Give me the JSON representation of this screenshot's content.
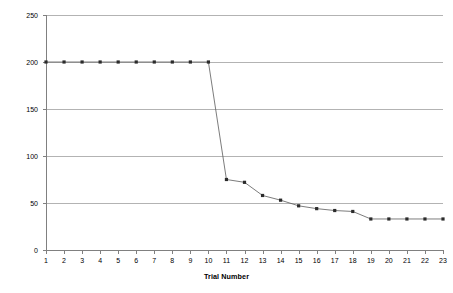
{
  "chart_data": {
    "type": "line",
    "title": "",
    "xlabel": "Trial Number",
    "ylabel": "Number of Moves",
    "x": [
      1,
      2,
      3,
      4,
      5,
      6,
      7,
      8,
      9,
      10,
      11,
      12,
      13,
      14,
      15,
      16,
      17,
      18,
      19,
      20,
      21,
      22,
      23
    ],
    "values": [
      200,
      200,
      200,
      200,
      200,
      200,
      200,
      200,
      200,
      200,
      75,
      72,
      58,
      53,
      47,
      44,
      42,
      41,
      33,
      33,
      33,
      33,
      33
    ],
    "series": [
      {
        "name": "Number of Moves",
        "values": [
          200,
          200,
          200,
          200,
          200,
          200,
          200,
          200,
          200,
          200,
          75,
          72,
          58,
          53,
          47,
          44,
          42,
          41,
          33,
          33,
          33,
          33,
          33
        ]
      }
    ],
    "xlim": [
      1,
      23
    ],
    "ylim": [
      0,
      250
    ],
    "yticks": [
      0,
      50,
      100,
      150,
      200,
      250
    ],
    "xticks": [
      "1",
      "2",
      "3",
      "4",
      "5",
      "6",
      "7",
      "8",
      "9",
      "10",
      "11",
      "12",
      "13",
      "14",
      "15",
      "16",
      "17",
      "18",
      "19",
      "20",
      "21",
      "22",
      "23"
    ],
    "ytick_labels": [
      "0",
      "50",
      "100",
      "150",
      "200",
      "250"
    ],
    "grid": "horizontal",
    "legend": "none",
    "marker": "filled-square",
    "line_color": "#5a5a5a",
    "marker_color": "#2b2b2b",
    "grid_color": "#b3b3b3",
    "axis_color": "#808080",
    "background": "#ffffff"
  }
}
